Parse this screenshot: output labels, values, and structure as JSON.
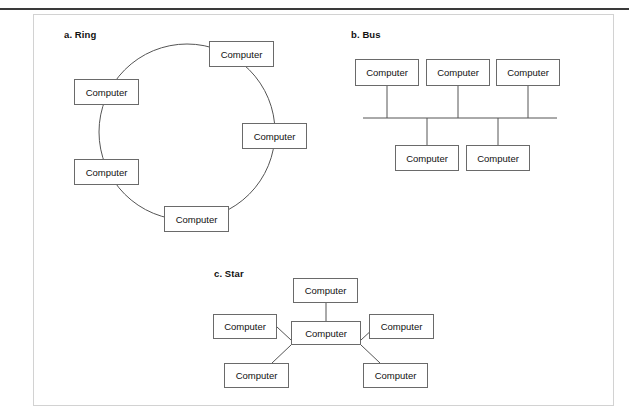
{
  "figure": {
    "caption_fragment": "",
    "frame": {
      "border_color": "#d2d2d2",
      "rule_color": "#3a3a3a"
    }
  },
  "node_label": "Computer",
  "panels": [
    {
      "id": "ring",
      "title": "a. Ring",
      "topology": "ring",
      "nodes": [
        {
          "label": "Computer",
          "position": "top"
        },
        {
          "label": "Computer",
          "position": "right"
        },
        {
          "label": "Computer",
          "position": "bottom"
        },
        {
          "label": "Computer",
          "position": "left-lower"
        },
        {
          "label": "Computer",
          "position": "left-upper"
        }
      ]
    },
    {
      "id": "bus",
      "title": "b. Bus",
      "topology": "bus",
      "nodes": [
        {
          "label": "Computer",
          "position": "top-left"
        },
        {
          "label": "Computer",
          "position": "top-center"
        },
        {
          "label": "Computer",
          "position": "top-right"
        },
        {
          "label": "Computer",
          "position": "bottom-left"
        },
        {
          "label": "Computer",
          "position": "bottom-right"
        }
      ]
    },
    {
      "id": "star",
      "title": "c. Star",
      "topology": "star",
      "nodes": [
        {
          "label": "Computer",
          "position": "top"
        },
        {
          "label": "Computer",
          "position": "left"
        },
        {
          "label": "Computer",
          "position": "hub"
        },
        {
          "label": "Computer",
          "position": "right"
        },
        {
          "label": "Computer",
          "position": "bottom-left"
        },
        {
          "label": "Computer",
          "position": "bottom-right"
        }
      ]
    }
  ]
}
